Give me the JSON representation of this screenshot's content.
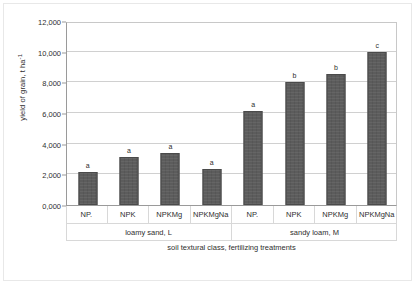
{
  "chart_data": {
    "type": "bar",
    "title": "",
    "xlabel": "soil textural class, fertilizing treatments",
    "ylabel": "yield of grain, t ha",
    "ylabel_sup": "-1",
    "categories": [
      "NP.",
      "NPK",
      "NPKMg",
      "NPKMgNa",
      "NP.",
      "NPK",
      "NPKMg",
      "NPKMgNa"
    ],
    "values": [
      2150,
      3100,
      3400,
      2350,
      6150,
      8050,
      8550,
      9950
    ],
    "letters": [
      "a",
      "a",
      "a",
      "a",
      "a",
      "b",
      "b",
      "c"
    ],
    "groups": [
      {
        "label": "loamy sand, L",
        "span": 4
      },
      {
        "label": "sandy loam, M",
        "span": 4
      }
    ],
    "ylim": [
      0,
      12000
    ],
    "ytick_values": [
      0,
      2000,
      4000,
      6000,
      8000,
      10000,
      12000
    ],
    "ytick_labels": [
      "0,000",
      "2,000",
      "4,000",
      "6,000",
      "8,000",
      "10,000",
      "12,000"
    ],
    "grid": true,
    "legend": "none",
    "bar_color": "#5c5c5c",
    "gridline_color": "#d0d0d0",
    "axis_color": "#9a9a9a"
  }
}
